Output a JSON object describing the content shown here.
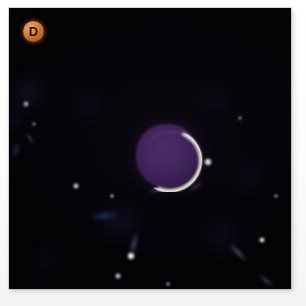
{
  "figure": {
    "panel_label": "D",
    "badge_color": "#d8813f",
    "badge_text_color": "#2a1206",
    "background_color": "#040306",
    "border_color": "#fdfdfd"
  },
  "scene": {
    "description": "dark-field astronomical image panel",
    "central_object": {
      "name": "purple-disc",
      "fill_color": "#3d2157",
      "highlight_color": "#4e2c6a",
      "center_x": 158,
      "center_y": 148,
      "width": 62,
      "height": 64
    },
    "crescent": {
      "name": "bright-limb-arc",
      "color": "#efe7df",
      "hot_color": "#fffaf3",
      "position": "lower-right limb of disc"
    },
    "nebulosity": [
      {
        "name": "neb-upper-left",
        "x": 28,
        "y": 92,
        "w": 34,
        "h": 40,
        "color": "rgba(46,52,110,0.32)"
      },
      {
        "name": "neb-left-mid",
        "x": 12,
        "y": 118,
        "w": 26,
        "h": 34,
        "color": "rgba(38,44,96,0.26)"
      },
      {
        "name": "neb-upper-mid",
        "x": 88,
        "y": 104,
        "w": 30,
        "h": 36,
        "color": "rgba(40,44,92,0.22)"
      },
      {
        "name": "neb-right-upper",
        "x": 212,
        "y": 96,
        "w": 38,
        "h": 34,
        "color": "rgba(30,36,84,0.20)"
      },
      {
        "name": "neb-lower-center",
        "x": 120,
        "y": 222,
        "w": 46,
        "h": 38,
        "color": "rgba(34,40,104,0.30)"
      },
      {
        "name": "neb-lower-right",
        "x": 222,
        "y": 236,
        "w": 42,
        "h": 40,
        "color": "rgba(32,38,98,0.26)"
      },
      {
        "name": "neb-bottom-left",
        "x": 46,
        "y": 262,
        "w": 36,
        "h": 28,
        "color": "rgba(28,32,80,0.20)"
      },
      {
        "name": "neb-right-mid",
        "x": 248,
        "y": 176,
        "w": 34,
        "h": 34,
        "color": "rgba(28,34,86,0.22)"
      }
    ],
    "point_sources": [
      {
        "name": "knot-upper-left-a",
        "x": 26,
        "y": 104,
        "r": 3.0,
        "color": "#9aa6d8"
      },
      {
        "name": "knot-upper-left-b",
        "x": 34,
        "y": 124,
        "r": 2.2,
        "color": "#7f8cc4"
      },
      {
        "name": "knot-mid-left",
        "x": 76,
        "y": 186,
        "r": 3.4,
        "color": "#cfd6ea"
      },
      {
        "name": "knot-mid-center",
        "x": 112,
        "y": 196,
        "r": 2.4,
        "color": "#b9c2de"
      },
      {
        "name": "knot-right-blob",
        "x": 208,
        "y": 162,
        "r": 4.0,
        "color": "#e6e2dc"
      },
      {
        "name": "knot-lower-white",
        "x": 131,
        "y": 256,
        "r": 4.2,
        "color": "#f0eee9"
      },
      {
        "name": "knot-lower-left",
        "x": 118,
        "y": 276,
        "r": 2.6,
        "color": "#c6ccdf"
      },
      {
        "name": "knot-right-star",
        "x": 262,
        "y": 240,
        "r": 3.2,
        "color": "#dfe3ef"
      },
      {
        "name": "knot-top-right",
        "x": 240,
        "y": 118,
        "r": 2.0,
        "color": "#8d96c6"
      },
      {
        "name": "knot-far-right",
        "x": 276,
        "y": 196,
        "r": 2.4,
        "color": "#99a2cc"
      },
      {
        "name": "knot-bottom-mid",
        "x": 168,
        "y": 284,
        "r": 2.2,
        "color": "#a8b0d4"
      }
    ],
    "filaments": [
      {
        "name": "streak-upper-mid",
        "x": 160,
        "y": 188,
        "w": 30,
        "h": 6,
        "rot": -22,
        "color": "rgba(214,218,236,0.55)"
      },
      {
        "name": "streak-left-diag",
        "x": 30,
        "y": 138,
        "w": 20,
        "h": 5,
        "rot": 58,
        "color": "rgba(150,160,210,0.45)"
      },
      {
        "name": "streak-center-lower",
        "x": 134,
        "y": 244,
        "w": 10,
        "h": 34,
        "rot": 14,
        "color": "rgba(120,132,196,0.50)"
      },
      {
        "name": "streak-blue-arc",
        "x": 104,
        "y": 216,
        "w": 38,
        "h": 12,
        "rot": -8,
        "color": "rgba(58,74,170,0.55)"
      },
      {
        "name": "streak-right-lower",
        "x": 238,
        "y": 252,
        "w": 34,
        "h": 7,
        "rot": 46,
        "color": "rgba(176,186,226,0.48)"
      },
      {
        "name": "streak-bottom-right",
        "x": 266,
        "y": 280,
        "w": 26,
        "h": 7,
        "rot": 40,
        "color": "rgba(148,160,214,0.42)"
      },
      {
        "name": "streak-top-right",
        "x": 196,
        "y": 186,
        "w": 22,
        "h": 5,
        "rot": -34,
        "color": "rgba(170,178,220,0.40)"
      },
      {
        "name": "streak-left-edge",
        "x": 16,
        "y": 150,
        "w": 8,
        "h": 22,
        "rot": 20,
        "color": "rgba(110,122,186,0.38)"
      }
    ]
  }
}
